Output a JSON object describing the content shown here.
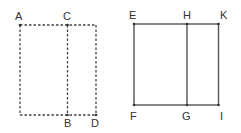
{
  "diagram": {
    "colors": {
      "line": "#444444",
      "label": "#333333",
      "background": "#ffffff"
    },
    "left_figure": {
      "style": "dashed",
      "labels": {
        "A": "A",
        "C": "C",
        "B": "B",
        "D": "D"
      }
    },
    "right_figure": {
      "style": "solid",
      "labels": {
        "E": "E",
        "H": "H",
        "K": "K",
        "F": "F",
        "G": "G",
        "I": "I"
      }
    }
  }
}
